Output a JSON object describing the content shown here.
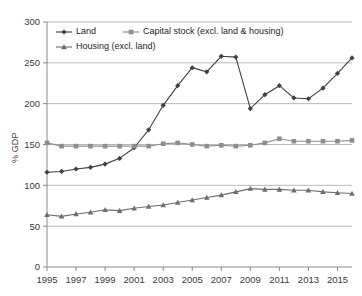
{
  "chart_data": {
    "type": "line",
    "title": "",
    "xlabel": "",
    "ylabel": "% GDP",
    "ylim": [
      0,
      300
    ],
    "ytick_step": 50,
    "yticks": [
      0,
      50,
      100,
      150,
      200,
      250,
      300
    ],
    "xlim": [
      1995,
      2016
    ],
    "xticks": [
      1995,
      1997,
      1999,
      2001,
      2003,
      2005,
      2007,
      2009,
      2011,
      2013,
      2015
    ],
    "x": [
      1995,
      1996,
      1997,
      1998,
      1999,
      2000,
      2001,
      2002,
      2003,
      2004,
      2005,
      2006,
      2007,
      2008,
      2009,
      2010,
      2011,
      2012,
      2013,
      2014,
      2015,
      2016
    ],
    "grid": "horizontal",
    "legend_position": "top-left-inside",
    "series": [
      {
        "name": "Land",
        "marker": "diamond",
        "color": "#3f3f3f",
        "values": [
          116,
          117,
          120,
          122,
          126,
          133,
          146,
          168,
          198,
          222,
          244,
          239,
          258,
          257,
          194,
          211,
          222,
          207,
          206,
          219,
          237,
          256
        ]
      },
      {
        "name": "Capital stock (excl. land & housing)",
        "marker": "square",
        "color": "#8d8d8d",
        "values": [
          152,
          148,
          148,
          148,
          148,
          148,
          148,
          148,
          151,
          152,
          150,
          148,
          149,
          148,
          149,
          152,
          157,
          154,
          154,
          154,
          154,
          155
        ]
      },
      {
        "name": "Housing (excl. land)",
        "marker": "triangle",
        "color": "#6d6d6d",
        "values": [
          64,
          62,
          65,
          67,
          70,
          69,
          72,
          74,
          76,
          79,
          82,
          85,
          88,
          92,
          96,
          95,
          95,
          94,
          94,
          92,
          91,
          90
        ]
      }
    ]
  },
  "legend": {
    "items": [
      {
        "label": "Land",
        "marker": "diamond",
        "color": "#3f3f3f"
      },
      {
        "label": "Capital stock (excl. land & housing)",
        "marker": "square",
        "color": "#8d8d8d"
      },
      {
        "label": "Housing (excl. land)",
        "marker": "triangle",
        "color": "#6d6d6d"
      }
    ]
  },
  "axes": {
    "y_axis_title": "% GDP"
  }
}
